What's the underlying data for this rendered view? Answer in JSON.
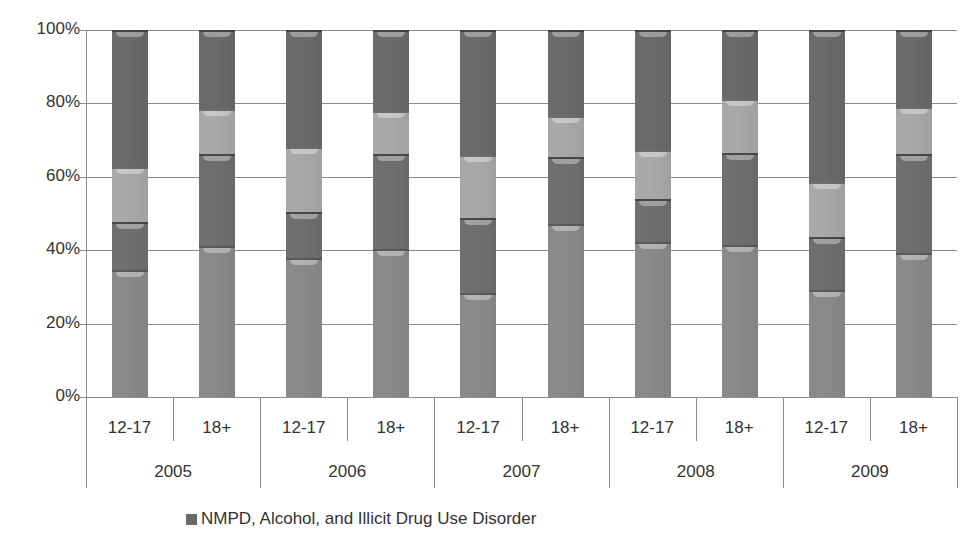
{
  "chart_data": {
    "type": "bar",
    "stacked": true,
    "percent_stacked": true,
    "title": "",
    "xlabel": "",
    "ylabel": "",
    "ylim": [
      0,
      100
    ],
    "yticks": [
      "0%",
      "20%",
      "40%",
      "60%",
      "80%",
      "100%"
    ],
    "grid": true,
    "groups": [
      "2005",
      "2006",
      "2007",
      "2008",
      "2009"
    ],
    "subcategories": [
      "12-17",
      "18+"
    ],
    "categories": [
      "2005 12-17",
      "2005 18+",
      "2006 12-17",
      "2006 18+",
      "2007 12-17",
      "2007 18+",
      "2008 12-17",
      "2008 18+",
      "2009 12-17",
      "2009 18+"
    ],
    "category_labels": [
      "12-17",
      "18+",
      "12-17",
      "18+",
      "12-17",
      "18+",
      "12-17",
      "18+",
      "12-17",
      "18+"
    ],
    "series": [
      {
        "name": "",
        "color": "#8a8a8a",
        "values": [
          34.6,
          41.2,
          38.0,
          40.2,
          28.3,
          47.2,
          42.2,
          41.5,
          29.2,
          39.2
        ]
      },
      {
        "name": "",
        "color": "#6f6f6f",
        "values": [
          13.1,
          24.9,
          12.3,
          26.0,
          20.4,
          18.1,
          11.8,
          24.9,
          14.3,
          27.0
        ]
      },
      {
        "name": "",
        "color": "#a9a9a9",
        "values": [
          15.0,
          12.4,
          17.9,
          11.8,
          17.3,
          11.3,
          13.2,
          14.7,
          15.2,
          12.7
        ]
      },
      {
        "name": "NMPD, Alcohol, and Illicit Drug Use Disorder",
        "color": "#6a6a6a",
        "values": [
          37.3,
          21.5,
          31.8,
          22.0,
          34.0,
          23.4,
          32.8,
          18.9,
          41.3,
          21.1
        ]
      }
    ],
    "legend": {
      "position": "bottom",
      "entries": [
        "NMPD, Alcohol, and Illicit Drug Use Disorder"
      ]
    }
  }
}
